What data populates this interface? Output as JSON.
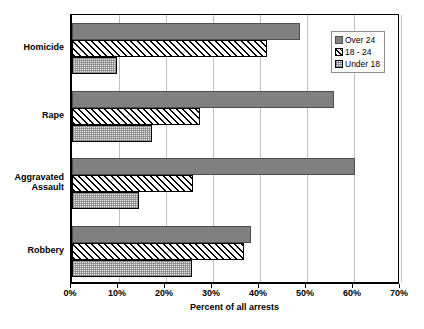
{
  "chart_data": {
    "type": "bar",
    "orientation": "horizontal",
    "title": "",
    "xlabel": "Percent of all arrests",
    "ylabel": "",
    "xlim": [
      0,
      70
    ],
    "xtick_labels": [
      "0%",
      "10%",
      "20%",
      "30%",
      "40%",
      "50%",
      "60%",
      "70%"
    ],
    "xtick_values": [
      0,
      10,
      20,
      30,
      40,
      50,
      60,
      70
    ],
    "grid": true,
    "legend_position": "top-right",
    "categories": [
      "Homicide",
      "Rape",
      "Aggravated\nAssault",
      "Robbery"
    ],
    "series": [
      {
        "name": "Over 24",
        "values": [
          48.5,
          55.8,
          60.2,
          38.0
        ]
      },
      {
        "name": "18 - 24",
        "values": [
          41.5,
          27.3,
          25.8,
          36.7
        ]
      },
      {
        "name": "Under 18",
        "values": [
          9.5,
          17.0,
          14.2,
          25.5
        ]
      }
    ]
  },
  "legend": {
    "items": [
      {
        "label": "Over 24",
        "key": "s-over24",
        "icon": "legend-swatch-solid-gray"
      },
      {
        "label": "18 - 24",
        "key": "s-18to24",
        "icon": "legend-swatch-diagonal-hatch"
      },
      {
        "label": "Under 18",
        "key": "s-under18",
        "icon": "legend-swatch-dotted-light"
      }
    ]
  },
  "colors": {
    "over_24": "#808080",
    "18_24": "#ffffff",
    "under_18": "#e3e3e3",
    "gridline": "#bfbfbf",
    "axis": "#000000"
  }
}
